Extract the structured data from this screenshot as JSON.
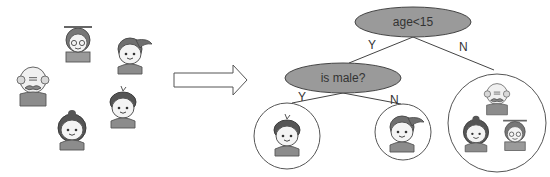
{
  "diagram": {
    "type": "decision-tree",
    "input_group": {
      "people": [
        {
          "id": "grandma",
          "role": "elderly woman"
        },
        {
          "id": "girl-ponytail",
          "role": "girl"
        },
        {
          "id": "grandpa",
          "role": "elderly man"
        },
        {
          "id": "boy",
          "role": "boy"
        },
        {
          "id": "woman",
          "role": "woman"
        }
      ]
    },
    "arrow": {
      "direction": "right"
    },
    "root": {
      "label": "age<15",
      "yes_label": "Y",
      "no_label": "N"
    },
    "child": {
      "label": "is male?",
      "yes_label": "Y",
      "no_label": "N"
    },
    "leaves": [
      {
        "id": "leaf-male-young",
        "members": [
          "boy"
        ]
      },
      {
        "id": "leaf-female-young",
        "members": [
          "girl-ponytail"
        ]
      },
      {
        "id": "leaf-adults",
        "members": [
          "grandpa",
          "woman",
          "grandma"
        ]
      }
    ],
    "colors": {
      "node_fill": "#9a9a9a",
      "stroke": "#555555",
      "background": "#ffffff"
    }
  }
}
